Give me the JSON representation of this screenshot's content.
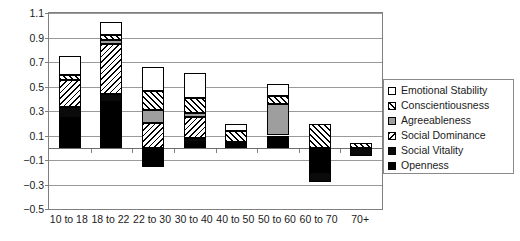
{
  "chart_data": {
    "type": "bar",
    "subtype": "stacked-bar",
    "title": "",
    "xlabel": "",
    "ylabel": "",
    "ylim": [
      -0.5,
      1.1
    ],
    "yticks": [
      -0.5,
      -0.3,
      -0.1,
      0.1,
      0.3,
      0.5,
      0.7,
      0.9,
      1.1
    ],
    "ytick_labels": [
      "−0.5",
      "−0.3",
      "−0.1",
      "0.1",
      "0.3",
      "0.5",
      "0.7",
      "0.9",
      "1.1"
    ],
    "grid": true,
    "legend_position": "right",
    "categories": [
      "10 to 18",
      "18 to 22",
      "22 to 30",
      "30 to 40",
      "40 to 50",
      "50 to 60",
      "60 to 70",
      "70+"
    ],
    "series": [
      {
        "name": "Openness",
        "pattern": "solid-black",
        "values": [
          0.24,
          0.37,
          -0.16,
          0.05,
          0.02,
          0.09,
          -0.2,
          0.0
        ]
      },
      {
        "name": "Social Vitality",
        "pattern": "solid-black",
        "values": [
          0.09,
          0.07,
          0.0,
          0.03,
          0.01,
          0.0,
          -0.08,
          -0.07
        ]
      },
      {
        "name": "Social Dominance",
        "pattern": "diagonal-hatch-down",
        "values": [
          0.22,
          0.41,
          0.2,
          0.17,
          0.02,
          0.01,
          0.0,
          0.0
        ]
      },
      {
        "name": "Agreeableness",
        "pattern": "solid-gray",
        "values": [
          0.0,
          0.03,
          0.11,
          0.03,
          0.0,
          0.26,
          0.0,
          0.0
        ]
      },
      {
        "name": "Conscientiousness",
        "pattern": "diagonal-hatch-up",
        "values": [
          0.04,
          0.04,
          0.15,
          0.13,
          0.09,
          0.06,
          0.19,
          0.04
        ]
      },
      {
        "name": "Emotional Stability",
        "pattern": "white",
        "values": [
          0.16,
          0.11,
          0.2,
          0.2,
          0.05,
          0.1,
          0.0,
          0.0
        ]
      }
    ],
    "totals_positive": [
      0.75,
      1.03,
      0.66,
      0.61,
      0.19,
      0.52,
      0.19,
      0.04
    ],
    "totals_negative": [
      0.0,
      0.0,
      -0.16,
      0.0,
      0.0,
      0.0,
      -0.28,
      -0.07
    ]
  },
  "legend": {
    "items": [
      {
        "label": "Emotional Stability",
        "swatch": "white-square-icon"
      },
      {
        "label": "Conscientiousness",
        "swatch": "hatched-square-icon"
      },
      {
        "label": "Agreeableness",
        "swatch": "gray-square-icon"
      },
      {
        "label": "Social Dominance",
        "swatch": "hatched-square-icon"
      },
      {
        "label": "Social Vitality",
        "swatch": "dark-square-icon"
      },
      {
        "label": "Openness",
        "swatch": "black-square-icon"
      }
    ]
  }
}
